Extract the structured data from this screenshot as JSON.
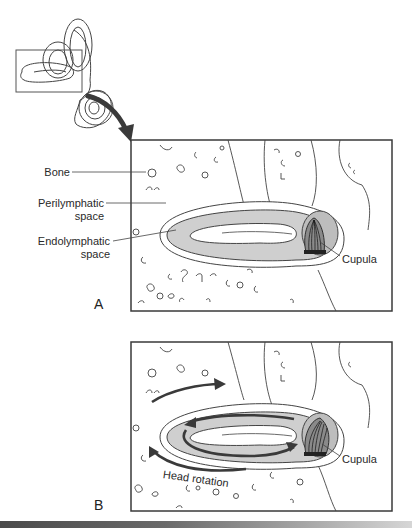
{
  "figure": {
    "overview": {
      "description": "Inner ear labyrinth outline with inset box over horizontal semicircular canal",
      "arrow": "curved-arrow-to-panel-a"
    },
    "panel_a": {
      "letter": "A",
      "labels": {
        "bone": "Bone",
        "perilymphatic_line1": "Perilymphatic",
        "perilymphatic_line2": "space",
        "endolymphatic_line1": "Endolymphatic",
        "endolymphatic_line2": "space",
        "cupula": "Cupula"
      }
    },
    "panel_b": {
      "letter": "B",
      "labels": {
        "head_rotation": "Head rotation",
        "cupula": "Cupula"
      }
    },
    "colors": {
      "line": "#333333",
      "frame": "#3a3a3a",
      "endolymph_fill": "#cfcfcf",
      "arrow": "#3a3a3a",
      "cupula_fill": "#8a8a8a"
    }
  }
}
